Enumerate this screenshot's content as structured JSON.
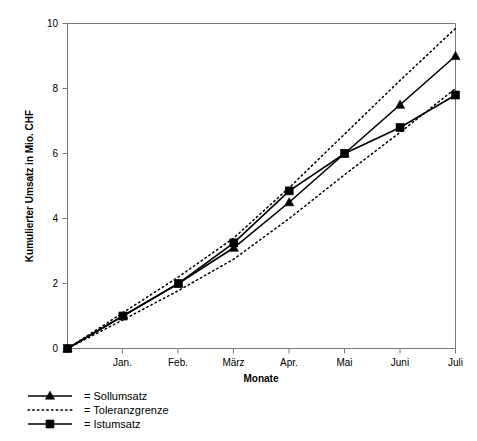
{
  "chart_data": {
    "type": "line",
    "title": "",
    "xlabel": "Monate",
    "ylabel": "Kumulierter Umsatz in Mio. CHF",
    "categories": [
      "",
      "Jan.",
      "Feb.",
      "März",
      "Apr.",
      "Mai",
      "Juni",
      "Juli"
    ],
    "x": [
      0,
      1,
      2,
      3,
      4,
      5,
      6,
      7
    ],
    "xlim": [
      0,
      7
    ],
    "ylim": [
      0,
      10
    ],
    "yticks": [
      0,
      2,
      4,
      6,
      8,
      10
    ],
    "ytick_labels": [
      "0",
      "2",
      "4",
      "6",
      "8",
      "10"
    ],
    "grid": false,
    "legend_position": "below-left",
    "series": [
      {
        "name": "Sollumsatz",
        "marker": "triangle",
        "style": "solid",
        "values": [
          0,
          1.0,
          2.0,
          3.1,
          4.5,
          6.0,
          7.5,
          9.0
        ]
      },
      {
        "name": "Toleranzgrenze",
        "marker": "none",
        "style": "dotted",
        "bound": "upper",
        "values": [
          0,
          1.1,
          2.2,
          3.4,
          4.95,
          6.6,
          8.25,
          9.85
        ]
      },
      {
        "name": "Toleranzgrenze",
        "marker": "none",
        "style": "dotted",
        "bound": "lower",
        "values": [
          0,
          0.88,
          1.78,
          2.75,
          4.0,
          5.35,
          6.65,
          8.0
        ]
      },
      {
        "name": "Istumsatz",
        "marker": "square",
        "style": "solid",
        "values": [
          0,
          1.0,
          2.0,
          3.25,
          4.85,
          6.0,
          6.8,
          7.8
        ]
      }
    ]
  },
  "legend": {
    "entries": [
      {
        "label": "= Sollumsatz",
        "marker": "triangle",
        "style": "solid"
      },
      {
        "label": "= Toleranzgrenze",
        "marker": "none",
        "style": "dotted"
      },
      {
        "label": "= Istumsatz",
        "marker": "square",
        "style": "solid"
      }
    ]
  },
  "axes": {
    "y_title": "Kumulierter Umsatz in Mio. CHF",
    "x_title": "Monate",
    "y_tick_0": "0",
    "y_tick_1": "2",
    "y_tick_2": "4",
    "y_tick_3": "6",
    "y_tick_4": "8",
    "y_tick_5": "10",
    "x_tick_1": "Jan.",
    "x_tick_2": "Feb.",
    "x_tick_3": "März",
    "x_tick_4": "Apr.",
    "x_tick_5": "Mai",
    "x_tick_6": "Juni",
    "x_tick_7": "Juli"
  },
  "colors": {
    "ink": "#000000",
    "axis": "#777777",
    "background": "#ffffff"
  }
}
